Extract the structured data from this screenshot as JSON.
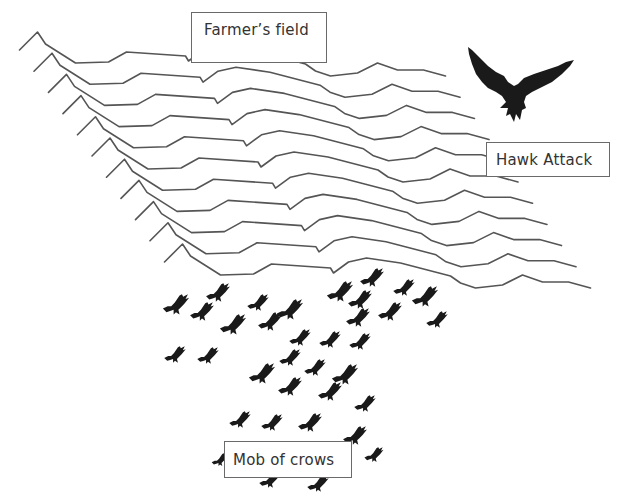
{
  "labels": {
    "field": "Farmer’s field",
    "hawk": "Hawk Attack",
    "crows": "Mob of crows"
  },
  "colors": {
    "background": "#ffffff",
    "lines": "#555555",
    "birds": "#1a1a1a",
    "label_border": "#6a6a6a",
    "label_text": "#333333"
  },
  "field_lines": {
    "count": 11,
    "offset_per_line": [
      14.5,
      21.2
    ],
    "base_points": [
      [
        19.5,
        50
      ],
      [
        37.5,
        32
      ],
      [
        45.5,
        44
      ],
      [
        75.5,
        63
      ],
      [
        108.5,
        62
      ],
      [
        126.5,
        52
      ],
      [
        185.5,
        56
      ],
      [
        188.5,
        61
      ],
      [
        203.5,
        50
      ],
      [
        221.5,
        46
      ],
      [
        255.5,
        51
      ],
      [
        305.5,
        64
      ],
      [
        315.5,
        71
      ],
      [
        330.5,
        76
      ],
      [
        357.5,
        73
      ],
      [
        377.5,
        63
      ],
      [
        397.5,
        70
      ],
      [
        423.5,
        70
      ],
      [
        445.5,
        76
      ]
    ]
  },
  "hawk": {
    "icon": "hawk-icon",
    "x": 466,
    "y": 44,
    "scale": 1.0
  },
  "crows": [
    [
      218,
      293,
      1.0
    ],
    [
      176,
      305,
      1.1
    ],
    [
      202,
      312,
      1.0
    ],
    [
      258,
      303,
      0.9
    ],
    [
      290,
      310,
      1.1
    ],
    [
      233,
      325,
      1.1
    ],
    [
      270,
      322,
      1.0
    ],
    [
      372,
      278,
      1.0
    ],
    [
      340,
      292,
      1.1
    ],
    [
      360,
      300,
      1.0
    ],
    [
      404,
      288,
      0.9
    ],
    [
      425,
      297,
      1.1
    ],
    [
      390,
      312,
      1.0
    ],
    [
      437,
      320,
      0.9
    ],
    [
      358,
      318,
      1.0
    ],
    [
      300,
      338,
      0.9
    ],
    [
      330,
      340,
      0.9
    ],
    [
      360,
      342,
      0.9
    ],
    [
      175,
      355,
      0.9
    ],
    [
      208,
      356,
      0.9
    ],
    [
      290,
      358,
      0.9
    ],
    [
      262,
      374,
      1.1
    ],
    [
      315,
      368,
      0.9
    ],
    [
      345,
      375,
      1.1
    ],
    [
      290,
      387,
      1.0
    ],
    [
      330,
      392,
      1.0
    ],
    [
      365,
      404,
      0.9
    ],
    [
      240,
      420,
      0.9
    ],
    [
      272,
      423,
      0.9
    ],
    [
      310,
      423,
      1.0
    ],
    [
      355,
      436,
      1.0
    ],
    [
      270,
      480,
      0.9
    ],
    [
      318,
      484,
      0.9
    ],
    [
      374,
      455,
      0.8
    ],
    [
      220,
      460,
      0.7
    ]
  ]
}
